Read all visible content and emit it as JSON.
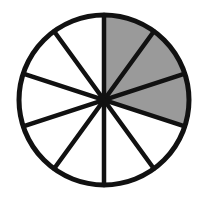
{
  "figure": {
    "background_color": "#ffffff"
  },
  "chart_data": {
    "type": "pie",
    "title": "",
    "subtitle": "",
    "xlabel": "",
    "ylabel": "",
    "grid": false,
    "legend_position": "none",
    "total_sectors": 10,
    "shaded_sectors": 3,
    "unshaded_sectors": 7,
    "sector_angle_degrees": 36,
    "fraction_shaded": "3/10",
    "fraction_decimal": 0.3,
    "percent_shaded": 30,
    "start_angle_degrees": 0,
    "rotation_note": "first sector boundary points straight up at 12 o'clock",
    "categories": [
      "sector-1",
      "sector-2",
      "sector-3",
      "sector-4",
      "sector-5",
      "sector-6",
      "sector-7",
      "sector-8",
      "sector-9",
      "sector-10"
    ],
    "values": [
      36,
      36,
      36,
      36,
      36,
      36,
      36,
      36,
      36,
      36
    ],
    "series": [
      {
        "name": "shaded",
        "values": [
          1,
          1,
          1,
          0,
          0,
          0,
          0,
          0,
          0,
          0
        ]
      }
    ],
    "sectors": [
      {
        "index": 1,
        "start_deg": 0,
        "end_deg": 36,
        "shaded": true,
        "fill": "#9a9a9a"
      },
      {
        "index": 2,
        "start_deg": 36,
        "end_deg": 72,
        "shaded": true,
        "fill": "#9a9a9a"
      },
      {
        "index": 3,
        "start_deg": 72,
        "end_deg": 108,
        "shaded": true,
        "fill": "#9a9a9a"
      },
      {
        "index": 4,
        "start_deg": 108,
        "end_deg": 144,
        "shaded": false,
        "fill": "#ffffff"
      },
      {
        "index": 5,
        "start_deg": 144,
        "end_deg": 180,
        "shaded": false,
        "fill": "#ffffff"
      },
      {
        "index": 6,
        "start_deg": 180,
        "end_deg": 216,
        "shaded": false,
        "fill": "#ffffff"
      },
      {
        "index": 7,
        "start_deg": 216,
        "end_deg": 252,
        "shaded": false,
        "fill": "#ffffff"
      },
      {
        "index": 8,
        "start_deg": 252,
        "end_deg": 288,
        "shaded": false,
        "fill": "#ffffff"
      },
      {
        "index": 9,
        "start_deg": 288,
        "end_deg": 324,
        "shaded": false,
        "fill": "#ffffff"
      },
      {
        "index": 10,
        "start_deg": 324,
        "end_deg": 360,
        "shaded": false,
        "fill": "#ffffff"
      }
    ],
    "geometry": {
      "center_x": 104,
      "center_y": 100,
      "radius": 85,
      "outline_width": 5,
      "spoke_width": 4.5,
      "spoke_count": 5
    },
    "colors": {
      "shaded_fill": "#9a9a9a",
      "unshaded_fill": "#ffffff",
      "stroke": "#111111",
      "background": "#ffffff"
    }
  }
}
